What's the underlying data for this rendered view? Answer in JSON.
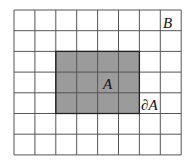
{
  "diagram": {
    "grid": {
      "columns": 8,
      "rows": 7,
      "origin": [
        14,
        10
      ],
      "cell_width": 20.9,
      "cell_height": 20.7,
      "line_color": "#555555",
      "background": "#ffffff"
    },
    "region_A": {
      "col_start": 2,
      "row_start": 2,
      "cols": 4,
      "rows": 3,
      "fill": "#9b9b9b",
      "border_color": "#222222"
    },
    "labels": {
      "set_B": "B",
      "set_A": "A",
      "boundary_A": "∂A"
    }
  }
}
